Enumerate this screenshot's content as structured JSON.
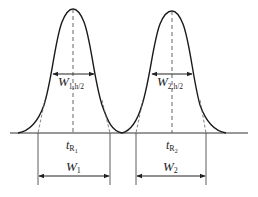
{
  "diagram": {
    "type": "chromatogram-resolution",
    "colors": {
      "curve": "#1a1a1a",
      "dashed": "#555555",
      "lines": "#333333",
      "background": "#ffffff"
    },
    "peaks": [
      {
        "id": "peak1",
        "retention_time_label": {
          "main": "t",
          "sub": "R",
          "subsub": "1"
        },
        "half_width_label": {
          "main": "W",
          "sub": "1,h/2"
        },
        "base_width_label": {
          "main": "W",
          "sub": "1"
        }
      },
      {
        "id": "peak2",
        "retention_time_label": {
          "main": "t",
          "sub": "R",
          "subsub": "2"
        },
        "half_width_label": {
          "main": "W",
          "sub": "2,h/2"
        },
        "base_width_label": {
          "main": "W",
          "sub": "2"
        }
      }
    ]
  }
}
